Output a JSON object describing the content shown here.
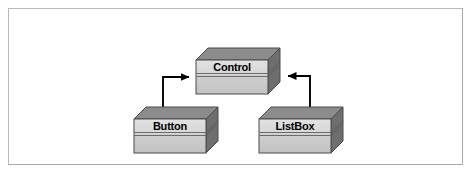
{
  "figure": {
    "type": "class-inheritance-diagram",
    "width": 473,
    "height": 175,
    "background_color": "#ffffff",
    "frame_color": "#b9b9b9"
  },
  "palette": {
    "box_top_face": "#8c8c8c",
    "box_side_face": "#6e6e6e",
    "box_front_face_light": "#dcdcdc",
    "box_front_face_dark": "#c4c4c4",
    "box_outline": "#4a4a4a",
    "divider_line": "#6b6b6b",
    "connector_line": "#000000",
    "label_color": "#000000"
  },
  "classes": [
    {
      "id": "control",
      "name": "Control",
      "role": "base-class",
      "position": {
        "x": 190,
        "y": 46
      }
    },
    {
      "id": "button",
      "name": "Button",
      "role": "derived-class",
      "position": {
        "x": 128,
        "y": 104
      }
    },
    {
      "id": "listbox",
      "name": "ListBox",
      "role": "derived-class",
      "position": {
        "x": 253,
        "y": 104
      }
    }
  ],
  "connectors": [
    {
      "id": "button-to-control",
      "from": "button",
      "to": "control",
      "relationship": "inheritance",
      "arrow_style": "solid-filled-triangle",
      "direction": "left-elbow-up-right"
    },
    {
      "id": "listbox-to-control",
      "from": "listbox",
      "to": "control",
      "relationship": "inheritance",
      "arrow_style": "solid-filled-triangle",
      "direction": "right-elbow-up-left"
    }
  ]
}
